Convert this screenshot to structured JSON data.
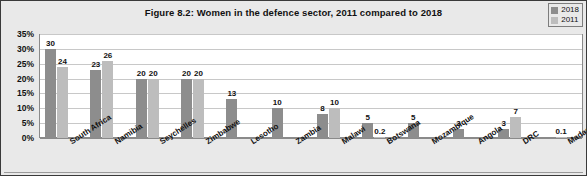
{
  "figure": {
    "title": "Figure 8.2: Women in the defence sector, 2011 compared to 2018"
  },
  "legend": {
    "position": "top-right",
    "entries": [
      {
        "label": "2018",
        "color": "#8d8d8d"
      },
      {
        "label": "2011",
        "color": "#bdbdbd"
      }
    ]
  },
  "axis": {
    "yticks": [
      "0%",
      "5%",
      "10%",
      "15%",
      "20%",
      "25%",
      "30%",
      "35%"
    ]
  },
  "chart_data": {
    "type": "bar",
    "title": "Figure 8.2: Women in the defence sector, 2011 compared to 2018",
    "xlabel": "",
    "ylabel": "",
    "ylim": [
      0,
      35
    ],
    "ytick_values": [
      0,
      5,
      10,
      15,
      20,
      25,
      30,
      35
    ],
    "ytick_labels": [
      "0%",
      "5%",
      "10%",
      "15%",
      "20%",
      "25%",
      "30%",
      "35%"
    ],
    "grid": true,
    "legend_position": "top-right",
    "categories": [
      "South Africa",
      "Namibia",
      "Seychelles",
      "Zimbabwe",
      "Lesotho",
      "Zambia",
      "Malawi",
      "Botswana",
      "Mozambique",
      "Angola",
      "DRC",
      "Madagascar"
    ],
    "series": [
      {
        "name": "2018",
        "color": "#8d8d8d",
        "values": [
          30,
          23,
          20,
          20,
          13,
          10,
          8,
          5,
          5,
          3,
          3,
          null
        ],
        "labels": [
          "30",
          "23",
          "20",
          "20",
          "13",
          "10",
          "8",
          "5",
          "5",
          "3",
          "3",
          ""
        ]
      },
      {
        "name": "2011",
        "color": "#bdbdbd",
        "values": [
          24,
          26,
          20,
          20,
          null,
          null,
          10,
          0.2,
          null,
          null,
          7,
          0.1
        ],
        "labels": [
          "24",
          "26",
          "20",
          "20",
          "",
          "",
          "10",
          "0.2",
          "",
          "",
          "7",
          "0.1"
        ]
      }
    ]
  }
}
